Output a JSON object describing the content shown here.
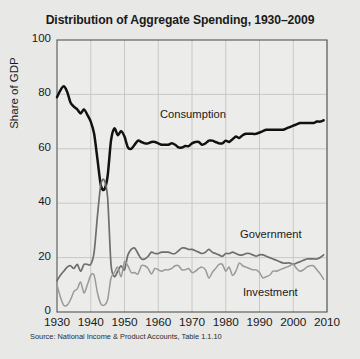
{
  "chart_data": {
    "type": "line",
    "title": "Distribution of Aggregate Spending, 1930–2009",
    "xlabel": "",
    "ylabel": "Share of GDP",
    "xlim": [
      1930,
      2010
    ],
    "ylim": [
      0,
      100
    ],
    "ytick_labels": [
      "0",
      "20",
      "40",
      "60",
      "80",
      "100"
    ],
    "ytick_values": [
      0,
      20,
      40,
      60,
      80,
      100
    ],
    "xtick_labels": [
      "1930",
      "1940",
      "1950",
      "1960",
      "1970",
      "1980",
      "1990",
      "2000",
      "2010"
    ],
    "xtick_values": [
      1930,
      1940,
      1950,
      1960,
      1970,
      1980,
      1990,
      2000,
      2010
    ],
    "grid": true,
    "legend_position": "inline-annotations",
    "annotations": [
      {
        "text": "Consumption",
        "x": 1962,
        "y": 71
      },
      {
        "text": "Government",
        "x": 1993,
        "y": 28
      },
      {
        "text": "Investment",
        "x": 1994,
        "y": 9
      }
    ],
    "source": "Source: National Income & Product Accounts, Table 1.1.10",
    "colors": {
      "consumption": "#111111",
      "government": "#6e6e6e",
      "investment": "#9a9a9a",
      "background": "#e8e8e6",
      "plot_background": "#ececea",
      "grid": "#c4c4c2",
      "axis": "#555555"
    },
    "series": [
      {
        "name": "Consumption",
        "color": "#111111",
        "x": [
          1930,
          1931,
          1932,
          1933,
          1934,
          1935,
          1936,
          1937,
          1938,
          1939,
          1940,
          1941,
          1942,
          1943,
          1944,
          1945,
          1946,
          1947,
          1948,
          1949,
          1950,
          1951,
          1952,
          1953,
          1954,
          1955,
          1956,
          1957,
          1958,
          1959,
          1960,
          1961,
          1962,
          1963,
          1964,
          1965,
          1966,
          1967,
          1968,
          1969,
          1970,
          1971,
          1972,
          1973,
          1974,
          1975,
          1976,
          1977,
          1978,
          1979,
          1980,
          1981,
          1982,
          1983,
          1984,
          1985,
          1986,
          1987,
          1988,
          1989,
          1990,
          1991,
          1992,
          1993,
          1994,
          1995,
          1996,
          1997,
          1998,
          1999,
          2000,
          2001,
          2002,
          2003,
          2004,
          2005,
          2006,
          2007,
          2008,
          2009
        ],
        "y": [
          79,
          81.5,
          83,
          81,
          77,
          75.5,
          74.5,
          73,
          74.5,
          72.5,
          70,
          65.5,
          56,
          46.5,
          45,
          50,
          63,
          67.5,
          65,
          66.5,
          64.5,
          60.5,
          60,
          61.5,
          63,
          62.5,
          62,
          62,
          62.5,
          62.5,
          62,
          61.5,
          61.5,
          61.5,
          62,
          61.5,
          60.5,
          60.5,
          61,
          61,
          62,
          62.5,
          62.5,
          61.5,
          62,
          63,
          63,
          62.5,
          62,
          62,
          63,
          62.5,
          63.5,
          64.5,
          64,
          65,
          65.5,
          65.5,
          65.5,
          65.5,
          66,
          66.5,
          67,
          67,
          67,
          67,
          67,
          67,
          67.5,
          68,
          68.5,
          69,
          69.5,
          69.5,
          69.5,
          69.5,
          69.5,
          70,
          70,
          70.5
        ]
      },
      {
        "name": "Government",
        "color": "#6e6e6e",
        "x": [
          1930,
          1931,
          1932,
          1933,
          1934,
          1935,
          1936,
          1937,
          1938,
          1939,
          1940,
          1941,
          1942,
          1943,
          1944,
          1945,
          1946,
          1947,
          1948,
          1949,
          1950,
          1951,
          1952,
          1953,
          1954,
          1955,
          1956,
          1957,
          1958,
          1959,
          1960,
          1961,
          1962,
          1963,
          1964,
          1965,
          1966,
          1967,
          1968,
          1969,
          1970,
          1971,
          1972,
          1973,
          1974,
          1975,
          1976,
          1977,
          1978,
          1979,
          1980,
          1981,
          1982,
          1983,
          1984,
          1985,
          1986,
          1987,
          1988,
          1989,
          1990,
          1991,
          1992,
          1993,
          1994,
          1995,
          1996,
          1997,
          1998,
          1999,
          2000,
          2001,
          2002,
          2003,
          2004,
          2005,
          2006,
          2007,
          2008,
          2009
        ],
        "y": [
          11.5,
          13.5,
          15,
          16.5,
          17,
          16,
          17.5,
          15,
          17.5,
          17.5,
          17.5,
          22,
          35.5,
          47,
          48.5,
          42,
          17.5,
          13,
          15,
          17,
          15.5,
          21,
          23,
          23.5,
          21.5,
          19.5,
          19.5,
          20.5,
          22,
          21.5,
          21.5,
          22,
          22,
          22,
          21.5,
          21.5,
          22.5,
          23.5,
          23.5,
          23,
          23,
          22.5,
          22,
          21.5,
          22,
          23,
          22,
          21.5,
          21,
          20.5,
          21.5,
          21.5,
          22,
          21.5,
          21,
          21,
          21.5,
          21.5,
          21,
          20.5,
          21,
          21,
          20.5,
          20,
          19.5,
          19,
          18.5,
          18,
          18,
          18,
          17.5,
          18,
          18.5,
          19,
          19.5,
          19.5,
          19.5,
          19.5,
          20,
          21
        ]
      },
      {
        "name": "Investment",
        "color": "#9a9a9a",
        "x": [
          1930,
          1931,
          1932,
          1933,
          1934,
          1935,
          1936,
          1937,
          1938,
          1939,
          1940,
          1941,
          1942,
          1943,
          1944,
          1945,
          1946,
          1947,
          1948,
          1949,
          1950,
          1951,
          1952,
          1953,
          1954,
          1955,
          1956,
          1957,
          1958,
          1959,
          1960,
          1961,
          1962,
          1963,
          1964,
          1965,
          1966,
          1967,
          1968,
          1969,
          1970,
          1971,
          1972,
          1973,
          1974,
          1975,
          1976,
          1977,
          1978,
          1979,
          1980,
          1981,
          1982,
          1983,
          1984,
          1985,
          1986,
          1987,
          1988,
          1989,
          1990,
          1991,
          1992,
          1993,
          1994,
          1995,
          1996,
          1997,
          1998,
          1999,
          2000,
          2001,
          2002,
          2003,
          2004,
          2005,
          2006,
          2007,
          2008,
          2009
        ],
        "y": [
          10,
          5.5,
          2.5,
          2.5,
          4.5,
          7.5,
          8.5,
          11,
          7,
          10,
          13.5,
          13.5,
          7,
          3,
          2.5,
          4.5,
          12.5,
          14.5,
          16.5,
          13,
          18.5,
          17,
          14.5,
          14.5,
          14,
          17,
          17,
          16,
          14,
          16,
          15.5,
          15,
          15.5,
          15.5,
          16,
          17,
          17,
          15.5,
          15.5,
          16,
          14.5,
          15,
          16,
          16.5,
          15.5,
          12.5,
          14.5,
          16,
          17.5,
          17.5,
          15,
          16.5,
          13.5,
          15,
          18,
          17,
          16.5,
          16,
          15.5,
          15.5,
          14.5,
          12.5,
          13,
          13.5,
          15,
          15,
          15.5,
          16,
          16.5,
          17,
          17.5,
          16,
          15,
          15.5,
          16.5,
          17,
          17,
          15.5,
          14,
          12
        ]
      }
    ]
  }
}
